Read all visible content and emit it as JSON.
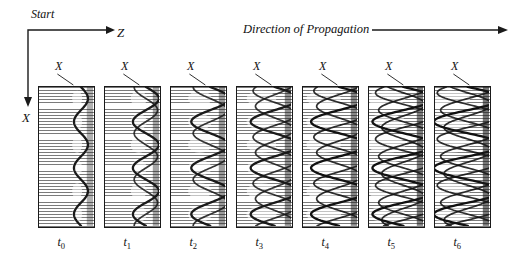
{
  "figure": {
    "title_left": "Start",
    "axis_z_label": "Z",
    "axis_x_label": "X",
    "propagation_label": "Direction of Propagation",
    "panel_x_label": "X",
    "background_color": "#ffffff",
    "ink_color": "#1a1a1a",
    "hatch_color": "#6f6f6f"
  },
  "chart_data": {
    "type": "line",
    "title": "Direction of Propagation",
    "xlabel": "Z",
    "ylabel": "X",
    "grid": false,
    "legend": null,
    "panel_count": 7,
    "categories": [
      "t0",
      "t1",
      "t2",
      "t3",
      "t4",
      "t5",
      "t6"
    ],
    "panels": [
      {
        "time_label": "t",
        "time_sub": "0",
        "x_label": "X",
        "trace_count": 1,
        "amplitude": 7,
        "cycles": 3.0,
        "center_x": 0.78,
        "shading": 0.1,
        "left": 38,
        "top": 86,
        "width": 57,
        "height": 142
      },
      {
        "time_label": "t",
        "time_sub": "1",
        "x_label": "X",
        "trace_count": 2,
        "amplitude": 13,
        "cycles": 3.0,
        "center_x": 0.76,
        "shading": 0.22,
        "left": 104,
        "top": 86,
        "width": 57,
        "height": 142
      },
      {
        "time_label": "t",
        "time_sub": "2",
        "x_label": "X",
        "trace_count": 2,
        "amplitude": 19,
        "cycles": 3.0,
        "center_x": 0.73,
        "shading": 0.32,
        "left": 170,
        "top": 86,
        "width": 57,
        "height": 142
      },
      {
        "time_label": "t",
        "time_sub": "3",
        "x_label": "X",
        "trace_count": 3,
        "amplitude": 24,
        "cycles": 3.0,
        "center_x": 0.7,
        "shading": 0.42,
        "left": 236,
        "top": 86,
        "width": 57,
        "height": 142
      },
      {
        "time_label": "t",
        "time_sub": "4",
        "x_label": "X",
        "trace_count": 3,
        "amplitude": 28,
        "cycles": 3.0,
        "center_x": 0.67,
        "shading": 0.52,
        "left": 302,
        "top": 86,
        "width": 57,
        "height": 142
      },
      {
        "time_label": "t",
        "time_sub": "5",
        "x_label": "X",
        "trace_count": 4,
        "amplitude": 31,
        "cycles": 3.0,
        "center_x": 0.64,
        "shading": 0.62,
        "left": 368,
        "top": 86,
        "width": 57,
        "height": 142
      },
      {
        "time_label": "t",
        "time_sub": "6",
        "x_label": "X",
        "trace_count": 4,
        "amplitude": 34,
        "cycles": 3.0,
        "center_x": 0.61,
        "shading": 0.7,
        "left": 434,
        "top": 86,
        "width": 57,
        "height": 142
      }
    ],
    "axes": {
      "origin": {
        "x": 28,
        "y": 30
      },
      "z_arrow_to": {
        "x": 112,
        "y": 30
      },
      "x_arrow_to": {
        "x": 28,
        "y": 103
      }
    },
    "propagation_arrow": {
      "from_x": 372,
      "to_x": 505,
      "y": 30
    }
  }
}
